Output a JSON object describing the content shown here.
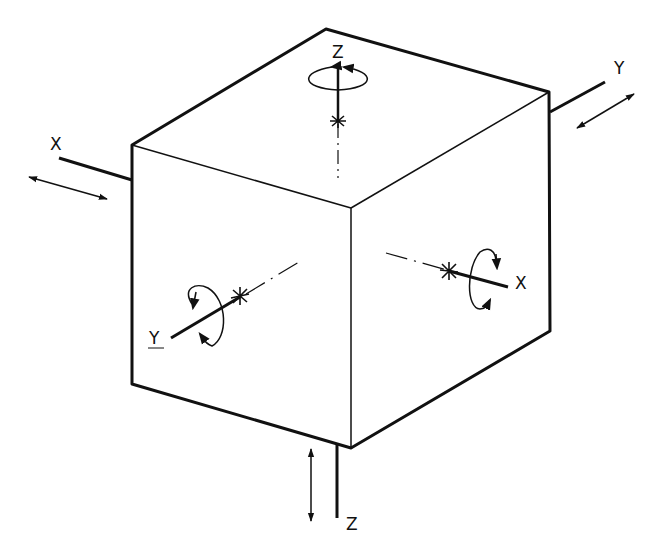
{
  "diagram": {
    "type": "isometric-cube-axes",
    "stroke_color": "#111111",
    "background": "#ffffff",
    "cube": {
      "faces": [
        "top-face",
        "left-face",
        "right-face"
      ]
    },
    "labels": {
      "top_z": "Z",
      "top_right_y": "Y",
      "left_x": "X",
      "left_face_y": "Y",
      "right_face_x": "X",
      "bottom_z": "Z"
    },
    "elements": [
      {
        "id": "z-rotation",
        "kind": "rotation-arrow",
        "axis": "Z",
        "face": "top"
      },
      {
        "id": "y-translation",
        "kind": "double-arrow",
        "axis": "Y",
        "position": "upper-right"
      },
      {
        "id": "x-translation",
        "kind": "double-arrow",
        "axis": "X",
        "position": "left"
      },
      {
        "id": "y-rotation",
        "kind": "rotation-arrow",
        "axis": "Y",
        "face": "left"
      },
      {
        "id": "x-rotation",
        "kind": "rotation-arrow",
        "axis": "X",
        "face": "right"
      },
      {
        "id": "z-translation",
        "kind": "double-arrow",
        "axis": "Z",
        "position": "bottom"
      }
    ]
  }
}
